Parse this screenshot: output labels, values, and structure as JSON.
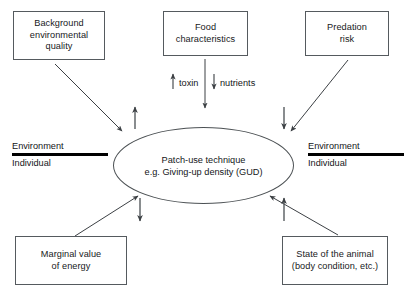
{
  "diagram": {
    "center": {
      "name": "patch-use-technique",
      "line1": "Patch-use technique",
      "line2": "e.g. Giving-up density (GUD)",
      "shape": "ellipse"
    },
    "boxes": [
      {
        "id": "background-environmental-quality",
        "line1": "Background",
        "line2": "environmental",
        "line3": "quality",
        "position": "top-left"
      },
      {
        "id": "food-characteristics",
        "line1": "Food",
        "line2": "characteristics",
        "line3": "",
        "position": "top-center"
      },
      {
        "id": "predation-risk",
        "line1": "Predation",
        "line2": "risk",
        "line3": "",
        "position": "top-right"
      },
      {
        "id": "marginal-value-of-energy",
        "line1": "Marginal value",
        "line2": "of energy",
        "line3": "",
        "position": "bottom-left"
      },
      {
        "id": "state-of-the-animal",
        "line1": "State of the animal",
        "line2": "(body condition, etc.)",
        "line3": "",
        "position": "bottom-right"
      }
    ],
    "dividers": [
      {
        "id": "divider-left",
        "above_label": "Environment",
        "below_label": "Individual"
      },
      {
        "id": "divider-right",
        "above_label": "Environment",
        "below_label": "Individual"
      }
    ],
    "flux_labels": [
      {
        "id": "toxin",
        "text": "toxin",
        "arrow": "up"
      },
      {
        "id": "nutrients",
        "text": "nutrients",
        "arrow": "down"
      }
    ],
    "connectors": [
      {
        "from": "background-environmental-quality",
        "to": "patch-use-technique",
        "style": "diagonal-arrow"
      },
      {
        "from": "food-characteristics",
        "to": "patch-use-technique",
        "style": "vertical-arrow"
      },
      {
        "from": "predation-risk",
        "to": "patch-use-technique",
        "style": "diagonal-arrow"
      },
      {
        "from": "marginal-value-of-energy",
        "to": "patch-use-technique",
        "style": "diagonal-arrow"
      },
      {
        "from": "state-of-the-animal",
        "to": "patch-use-technique",
        "style": "diagonal-arrow"
      }
    ],
    "indicator_arrows": [
      {
        "id": "indicator-top-left",
        "direction": "up"
      },
      {
        "id": "indicator-top-right",
        "direction": "down"
      },
      {
        "id": "indicator-bottom-left",
        "direction": "down"
      },
      {
        "id": "indicator-bottom-right",
        "direction": "up"
      }
    ],
    "colors": {
      "box_stroke": "#555a5e",
      "ellipse_stroke": "#4c5154",
      "connector": "#3c4044",
      "divider_rule": "#000000",
      "text": "#141618",
      "background": "#ffffff"
    }
  }
}
